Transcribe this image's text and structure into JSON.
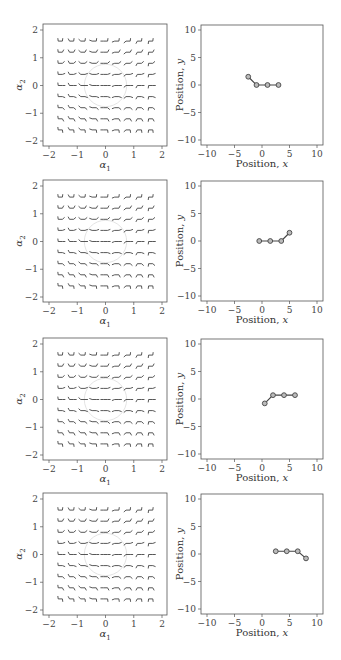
{
  "figure": {
    "rows": 4,
    "left_panel": {
      "xlabel": "α1",
      "ylabel": "α2",
      "xlim": [
        -2,
        2
      ],
      "ylim": [
        -2,
        2
      ],
      "xticks": [
        "−2",
        "−1",
        "0",
        "1",
        "2"
      ],
      "yticks": [
        "2",
        "1",
        "0",
        "−1",
        "−2"
      ],
      "grid_values": [
        -1.6,
        -1.2,
        -0.8,
        -0.4,
        0,
        0.4,
        0.8,
        1.2,
        1.6
      ],
      "circle_radius": 0.75
    },
    "right_panel": {
      "xlabel": "Position, x",
      "ylabel": "Position, y",
      "xlim": [
        -11,
        11
      ],
      "ylim": [
        -11,
        11
      ],
      "xticks": [
        "−10",
        "−5",
        "0",
        "5",
        "10"
      ],
      "yticks": [
        "10",
        "5",
        "0",
        "−5",
        "−10"
      ]
    }
  },
  "chart_data": [
    {
      "type": "line",
      "title": "Row 1 - snake configuration",
      "xlabel": "Position, x",
      "ylabel": "Position, y",
      "xlim": [
        -11,
        11
      ],
      "ylim": [
        -11,
        11
      ],
      "x": [
        -2.5,
        -1.0,
        1.0,
        3.0
      ],
      "y": [
        1.5,
        0.0,
        0.0,
        0.0
      ],
      "markers": "circle"
    },
    {
      "type": "line",
      "title": "Row 2 - snake configuration",
      "xlabel": "Position, x",
      "ylabel": "Position, y",
      "xlim": [
        -11,
        11
      ],
      "ylim": [
        -11,
        11
      ],
      "x": [
        -0.5,
        1.5,
        3.5,
        5.0
      ],
      "y": [
        0.0,
        0.0,
        0.0,
        1.5
      ],
      "markers": "circle"
    },
    {
      "type": "line",
      "title": "Row 3 - snake configuration",
      "xlabel": "Position, x",
      "ylabel": "Position, y",
      "xlim": [
        -11,
        11
      ],
      "ylim": [
        -11,
        11
      ],
      "x": [
        0.5,
        2.0,
        4.0,
        6.0
      ],
      "y": [
        -0.8,
        0.7,
        0.7,
        0.7
      ],
      "markers": "circle"
    },
    {
      "type": "line",
      "title": "Row 4 - snake configuration",
      "xlabel": "Position, x",
      "ylabel": "Position, y",
      "xlim": [
        -11,
        11
      ],
      "ylim": [
        -11,
        11
      ],
      "x": [
        2.5,
        4.5,
        6.5,
        8.0
      ],
      "y": [
        0.5,
        0.5,
        0.5,
        -0.8
      ],
      "markers": "circle"
    }
  ]
}
